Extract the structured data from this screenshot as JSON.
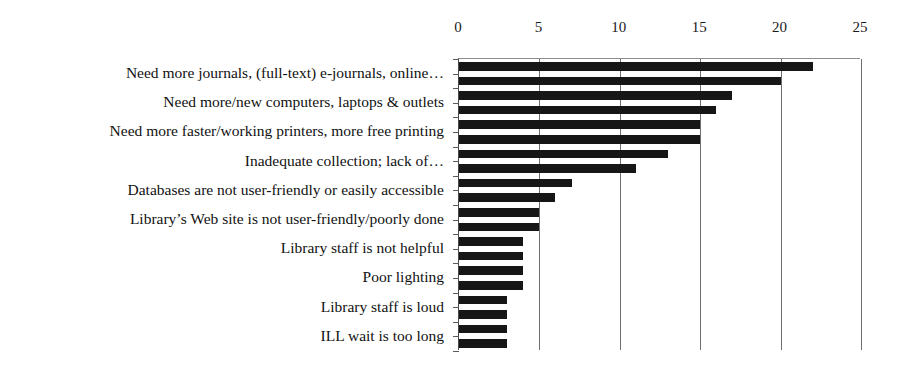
{
  "chart_data": {
    "type": "bar",
    "orientation": "horizontal",
    "title": "",
    "xlabel": "",
    "ylabel": "",
    "xlim": [
      0,
      25
    ],
    "xticks": [
      0,
      5,
      10,
      15,
      20,
      25
    ],
    "xtick_labels": [
      "0",
      "5",
      "10",
      "15",
      "20",
      "25"
    ],
    "grid": true,
    "legend": "none",
    "axis_position": "top",
    "categories": [
      "Need more journals, (full-text) e-journals, online…",
      "Need more/new computers, laptops & outlets",
      "Need more faster/working printers, more free printing",
      "Inadequate collection; lack of…",
      "Databases are not user-friendly or easily accessible",
      "Library’s Web site is not user-friendly/poorly done",
      "Library staff is not helpful",
      "Poor lighting",
      "Library staff is loud",
      "ILL wait is too long"
    ],
    "series": [
      {
        "name": "series-1",
        "values": [
          22,
          17,
          15,
          13,
          7,
          5,
          4,
          4,
          3,
          3
        ]
      },
      {
        "name": "series-2",
        "values": [
          20,
          16,
          15,
          11,
          6,
          5,
          4,
          4,
          3,
          3
        ]
      }
    ],
    "bar_color": "#161616",
    "grid_color": "#6f6f6f",
    "axis_color": "#4a4a4a"
  }
}
